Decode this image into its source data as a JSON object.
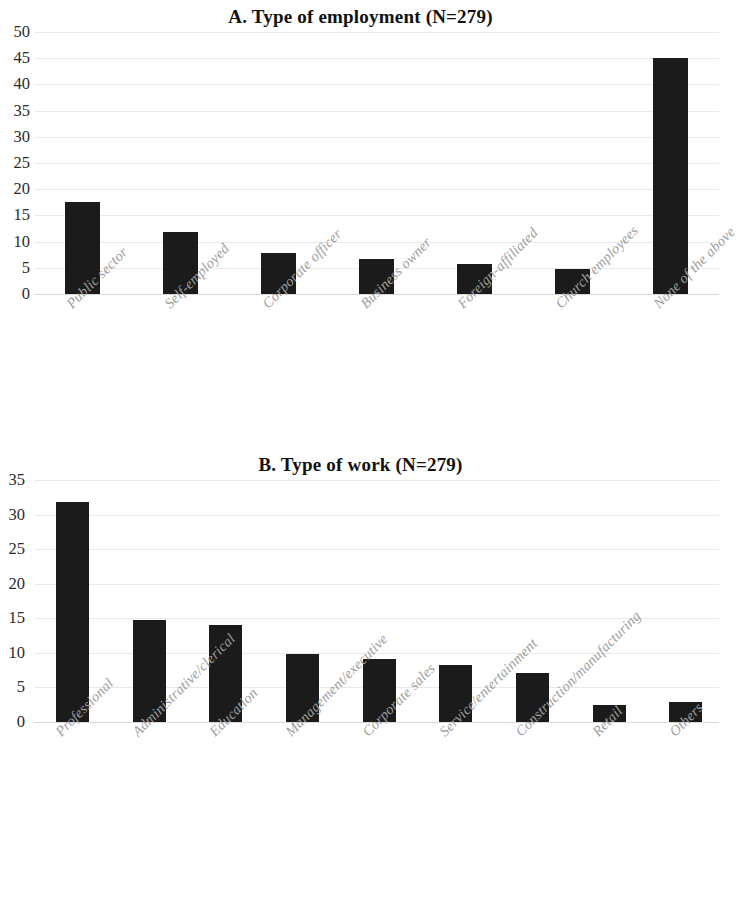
{
  "figure": {
    "panels": [
      "A",
      "B"
    ],
    "bar_color": "#1b1b1b",
    "gridline_color": "#e9e9ea",
    "label_color": "#9e9e9e"
  },
  "chart_data": [
    {
      "type": "bar",
      "panel": "A",
      "title": "A.  Type of employment (N=279)",
      "xlabel": "",
      "ylabel": "",
      "ylim": [
        0,
        50
      ],
      "ytick_step": 5,
      "yticks": [
        "50",
        "45",
        "40",
        "35",
        "30",
        "25",
        "20",
        "15",
        "10",
        "5",
        "0"
      ],
      "grid": true,
      "legend": false,
      "categories": [
        "Public sector",
        "Self-employed",
        "Corporate officer",
        "Business owner",
        "Foreign-affiliated",
        "Church employees",
        "None of the above"
      ],
      "values": [
        17.5,
        11.8,
        7.8,
        6.7,
        5.7,
        4.8,
        45.0
      ]
    },
    {
      "type": "bar",
      "panel": "B",
      "title": "B.  Type of work (N=279)",
      "xlabel": "",
      "ylabel": "",
      "ylim": [
        0,
        35
      ],
      "ytick_step": 5,
      "yticks": [
        "35",
        "30",
        "25",
        "20",
        "15",
        "10",
        "5",
        "0"
      ],
      "grid": true,
      "legend": false,
      "categories": [
        "Professional",
        "Administrative/clerical",
        "Education",
        "Management/executive",
        "Corporate sales",
        "Service/entertainment",
        "Construction/manufacturing",
        "Retail",
        "Others"
      ],
      "values": [
        31.8,
        14.8,
        14.1,
        9.8,
        9.1,
        8.3,
        7.1,
        2.5,
        2.9
      ]
    }
  ]
}
